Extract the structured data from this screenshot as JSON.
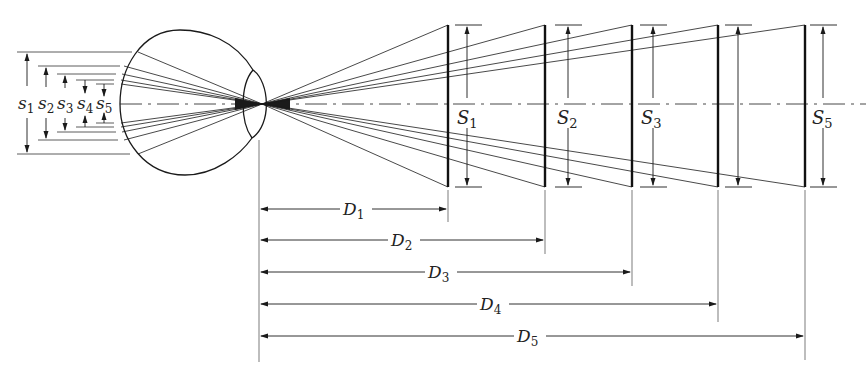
{
  "diagram": {
    "colors": {
      "ink": "#1a1a1a",
      "background": "#ffffff"
    },
    "retinal_image_labels": [
      {
        "base": "s",
        "sub": "1"
      },
      {
        "base": "s",
        "sub": "2"
      },
      {
        "base": "s",
        "sub": "3"
      },
      {
        "base": "s",
        "sub": "4"
      },
      {
        "base": "s",
        "sub": "5"
      }
    ],
    "object_size_labels": [
      {
        "base": "S",
        "sub": "1"
      },
      {
        "base": "S",
        "sub": "2"
      },
      {
        "base": "S",
        "sub": "3"
      },
      {
        "base": "S",
        "sub": "5"
      }
    ],
    "distance_labels": [
      {
        "base": "D",
        "sub": "1"
      },
      {
        "base": "D",
        "sub": "2"
      },
      {
        "base": "D",
        "sub": "3"
      },
      {
        "base": "D",
        "sub": "4"
      },
      {
        "base": "D",
        "sub": "5"
      }
    ]
  }
}
